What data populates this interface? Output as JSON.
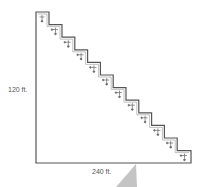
{
  "diagram": {
    "type": "stepped-right-triangle",
    "height_label": "120 ft.",
    "width_label": "240 ft.",
    "step_count": 12,
    "step_icon": "plant-cross-icon",
    "colors": {
      "outline": "#555555",
      "icon": "#666666",
      "wedge": "#b8b8b8"
    }
  }
}
